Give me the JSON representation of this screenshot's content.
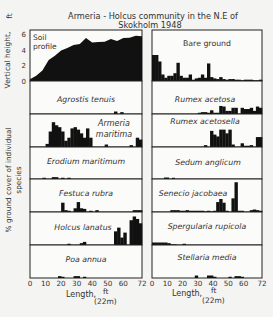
{
  "figure": {
    "title_line1": "Armeria - Holcus community in the N.E of",
    "title_line2": "Skokholm 1948",
    "y_label_top": "Vertical height,",
    "y_label_top_unit": "ft",
    "y_label_bottom_line1": "% ground cover of individual",
    "y_label_bottom_line2": "species",
    "soil_ticks": [
      "0",
      "2",
      "4",
      "6"
    ],
    "x_ticks": [
      "0",
      "10",
      "20",
      "30",
      "40",
      "50",
      "60",
      "72"
    ],
    "x_label": "Length,",
    "x_unit": "ft",
    "x_unit_metric": "(22m)"
  },
  "chart_data": {
    "type": "bar",
    "title": "Armeria - Holcus community in the N.E of Skokholm 1948",
    "xlabel": "Length, ft (22m)",
    "ylabel": "% ground cover of individual species",
    "xlim": [
      0,
      72
    ],
    "x_bin_ft": 2,
    "soil_profile": {
      "name": "Soil profile",
      "ylabel": "Vertical height, ft",
      "ylim": [
        0,
        6
      ],
      "x": [
        0,
        4,
        8,
        12,
        16,
        20,
        24,
        28,
        32,
        36,
        40,
        44,
        48,
        52,
        56,
        60,
        64,
        68,
        72
      ],
      "values": [
        0.3,
        0.6,
        1.4,
        2.6,
        3.3,
        3.8,
        4.3,
        4.5,
        4.8,
        5.4,
        5.0,
        4.9,
        5.1,
        5.3,
        5.2,
        5.4,
        5.6,
        5.7,
        5.8
      ]
    },
    "left_column": [
      {
        "name": "Agrostis tenuis",
        "values": [
          0,
          0,
          0,
          0,
          0,
          0,
          0,
          0,
          0,
          0,
          0,
          0,
          0,
          0,
          0,
          0,
          0,
          0,
          0,
          0,
          0,
          0,
          0,
          0,
          0,
          0,
          0,
          0.4,
          0,
          0.3,
          0,
          0,
          0,
          0,
          0,
          0
        ]
      },
      {
        "name": "Armeria maritima",
        "values": [
          0,
          0,
          0,
          0,
          0,
          0.5,
          2.5,
          4,
          3.5,
          3.2,
          2.5,
          1,
          1.5,
          3,
          3.2,
          2.8,
          2.2,
          1.5,
          3,
          1.5,
          0,
          0,
          0,
          0,
          0.4,
          0,
          0,
          0,
          0,
          0,
          0,
          0,
          0.3,
          0,
          1.5,
          1.2
        ]
      },
      {
        "name": "Erodium maritimum",
        "values": [
          0,
          0,
          0,
          0,
          0.2,
          0,
          0,
          0.3,
          0.3,
          0,
          0.2,
          0,
          0.2,
          0,
          0,
          0,
          0,
          0,
          0,
          0,
          0,
          0,
          0,
          0,
          0,
          0,
          0,
          0,
          0,
          0,
          0,
          0,
          0,
          0,
          0,
          0
        ]
      },
      {
        "name": "Festuca rubra",
        "values": [
          0,
          0,
          0,
          0,
          0,
          0,
          0,
          0,
          0,
          0,
          1.5,
          0.3,
          0.2,
          0,
          0.6,
          1.6,
          0.6,
          0.5,
          0,
          0.2,
          0,
          0.3,
          0,
          0,
          0,
          0,
          0,
          0,
          0,
          0,
          0,
          0,
          0,
          0.3,
          0.3,
          0.3
        ]
      },
      {
        "name": "Holcus lanatus",
        "values": [
          0,
          0,
          0,
          0,
          0,
          0,
          0,
          0,
          0,
          0,
          0,
          0,
          0.2,
          0,
          0,
          0,
          0.3,
          0.5,
          0,
          0,
          0,
          0,
          0,
          0,
          0,
          0,
          0,
          2.2,
          2.8,
          1.2,
          2,
          0,
          4,
          4.6,
          4.2,
          3.5
        ]
      },
      {
        "name": "Poa annua",
        "values": [
          0,
          0,
          0,
          0,
          0,
          0,
          0,
          0,
          0,
          0.3,
          0.2,
          0,
          0,
          0,
          0.3,
          0.3,
          0,
          0.2,
          0,
          0,
          0,
          0,
          0,
          0,
          0,
          0,
          0,
          0,
          0,
          0,
          0,
          0,
          0,
          0,
          0,
          0
        ]
      }
    ],
    "right_column": [
      {
        "name": "Bare ground",
        "values": [
          4,
          4,
          3,
          1,
          0.5,
          0.8,
          0.8,
          1.2,
          2.8,
          0.8,
          0.5,
          0.5,
          1,
          0.2,
          0.4,
          0.5,
          1,
          0.5,
          2.7,
          0.6,
          0.4,
          0.3,
          0.6,
          0.3,
          0.2,
          0.3,
          0.3,
          0.2,
          0.2,
          0.1,
          0.2,
          0.2,
          0.2,
          0.1,
          0.1,
          0.2
        ]
      },
      {
        "name": "Rumex acetosa",
        "values": [
          0,
          0,
          0,
          0,
          0,
          0,
          0,
          0,
          0,
          0,
          0,
          0,
          0,
          0,
          0,
          0.2,
          0.3,
          0.3,
          0.2,
          0.6,
          0.2,
          0.2,
          1.3,
          1.2,
          0.5,
          0.5,
          1,
          1,
          0,
          1,
          0.8,
          0.8,
          1,
          0.5,
          1.2,
          1
        ]
      },
      {
        "name": "Rumex acetosella",
        "values": [
          0,
          0,
          0,
          0,
          0,
          0,
          0,
          0,
          0,
          0,
          0,
          0,
          0,
          0,
          0,
          0,
          0,
          0.3,
          0,
          2.6,
          2,
          1.7,
          2.8,
          2.8,
          2.2,
          2.8,
          0.4,
          0,
          0,
          0.6,
          0.2,
          0.2,
          0.3,
          0,
          1.6,
          1.6
        ]
      },
      {
        "name": "Sedum anglicum",
        "values": [
          0,
          0,
          0,
          0,
          0,
          0,
          0,
          0,
          0,
          0,
          0,
          0,
          0,
          0,
          0,
          0,
          0,
          0,
          0,
          0,
          0,
          0,
          0,
          0,
          0,
          0,
          0,
          0,
          0,
          0,
          0,
          0,
          0,
          0,
          0,
          0
        ]
      },
      {
        "name": "Senecio jacobaea",
        "values": [
          0,
          0,
          0,
          0,
          0,
          0,
          0.3,
          0.3,
          0.3,
          0.2,
          0.2,
          0.3,
          0.2,
          0.2,
          0.2,
          0.2,
          0.2,
          0.1,
          0.2,
          0.1,
          0.2,
          1.6,
          2.1,
          1.5,
          0.2,
          0,
          2.2,
          4.8,
          0.2,
          0.2,
          0,
          0,
          0.3,
          0.4,
          0.3,
          0.2
        ]
      },
      {
        "name": "Spergularia rupicola",
        "values": [
          0.4,
          0.4,
          0.4,
          0.4,
          0.4,
          0.3,
          0.1,
          0.1,
          0,
          0,
          0.2,
          0,
          0,
          0,
          0,
          0,
          0,
          0,
          0,
          0,
          0,
          0,
          0,
          0,
          0,
          0,
          0,
          0,
          0,
          0,
          0,
          0,
          0,
          0,
          0,
          0
        ]
      },
      {
        "name": "Stellaria media",
        "values": [
          0,
          0,
          0,
          0,
          0,
          0,
          0,
          0,
          0,
          0,
          0,
          0,
          0,
          0,
          0.4,
          0,
          0,
          0,
          0.4,
          0.4,
          0.2,
          0,
          0,
          0,
          0,
          0.2,
          0,
          0.3,
          0.3,
          0.2,
          0,
          0,
          0,
          0,
          0,
          0
        ]
      }
    ],
    "pre_sedum_bars_note": "Sedum anglicum shows small bars near 20-25 ft",
    "sedum_values": [
      0,
      0,
      0,
      0,
      0,
      0,
      0,
      0,
      0,
      0,
      0,
      0,
      0,
      0,
      0,
      0,
      0,
      0,
      0,
      0,
      0,
      0,
      0,
      0,
      0,
      0,
      0,
      0,
      0,
      0,
      0,
      0,
      0,
      0,
      0,
      0
    ]
  }
}
